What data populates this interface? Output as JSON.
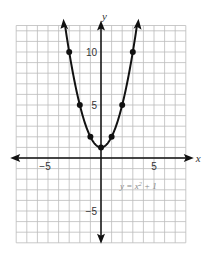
{
  "chart_data": {
    "type": "line",
    "title": "",
    "xlabel": "x",
    "ylabel": "y",
    "equation_label": "y = x² + 1",
    "equation_parts": {
      "lhs": "y = x",
      "exp": "2",
      "rhs": " + 1"
    },
    "xlim": [
      -8,
      8
    ],
    "ylim": [
      -8,
      12.5
    ],
    "grid": true,
    "x_ticks": [
      {
        "value": -5,
        "label": "−5"
      },
      {
        "value": 5,
        "label": "5"
      }
    ],
    "y_ticks": [
      {
        "value": 10,
        "label": "10"
      },
      {
        "value": 5,
        "label": "5"
      },
      {
        "value": -5,
        "label": "−5"
      }
    ],
    "series": [
      {
        "name": "y = x² + 1",
        "function": "x^2 + 1",
        "x_range": [
          -3.4,
          3.4
        ],
        "points": [
          {
            "x": -3,
            "y": 10
          },
          {
            "x": -2,
            "y": 5
          },
          {
            "x": -1,
            "y": 2
          },
          {
            "x": 0,
            "y": 1
          },
          {
            "x": 1,
            "y": 2
          },
          {
            "x": 2,
            "y": 5
          },
          {
            "x": 3,
            "y": 10
          }
        ]
      }
    ],
    "colors": {
      "grid": "#bbbbbb",
      "axis": "#111111",
      "curve": "#111111",
      "equation": "#888888"
    }
  }
}
